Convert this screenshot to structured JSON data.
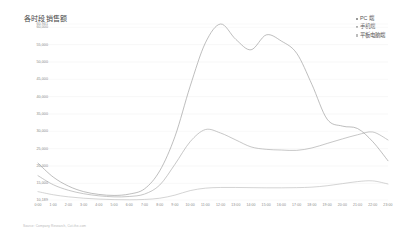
{
  "title": "各时段销售额",
  "footer": "Source: Company Research, Cut-the-com",
  "colors": {
    "pc": "#9a9a9a",
    "mobile": "#a8a8a8",
    "tablet": "#bdbdbd",
    "grid": "#f0f0f0",
    "axis_text": "#8a8a8a"
  },
  "legend": {
    "position": "top-right",
    "items": [
      {
        "label": "PC 端",
        "color": "#9a9a9a",
        "key": "pc"
      },
      {
        "label": "手机端",
        "color": "#a8a8a8",
        "key": "mobile"
      },
      {
        "label": "平板电脑端",
        "color": "#bdbdbd",
        "key": "tablet"
      }
    ]
  },
  "chart_data": {
    "type": "line",
    "title": "各时段销售额",
    "xlabel": "",
    "ylabel": "",
    "grid": true,
    "ylim": [
      10189,
      60941
    ],
    "yticks": [
      10189,
      15000,
      20000,
      25000,
      30000,
      35000,
      40000,
      45000,
      50000,
      55000,
      60000,
      60941
    ],
    "ytick_labels": [
      "10,189",
      "15,000",
      "20,000",
      "25,000",
      "30,000",
      "35,000",
      "40,000",
      "45,000",
      "50,000",
      "55,000",
      "60,000",
      "60,941"
    ],
    "categories": [
      "0:00",
      "1:00",
      "2:00",
      "3:00",
      "4:00",
      "5:00",
      "6:00",
      "7:00",
      "8:00",
      "9:00",
      "10:00",
      "11:00",
      "12:00",
      "13:00",
      "14:00",
      "15:00",
      "16:00",
      "17:00",
      "18:00",
      "19:00",
      "20:00",
      "21:00",
      "22:00",
      "23:00"
    ],
    "series": [
      {
        "name": "PC 端",
        "color": "#9a9a9a",
        "values": [
          20800,
          16800,
          14200,
          12600,
          11800,
          11500,
          11900,
          13400,
          18600,
          28500,
          43000,
          55500,
          60941,
          56500,
          53500,
          57800,
          56000,
          52500,
          43500,
          33500,
          31500,
          30800,
          27000,
          21500
        ]
      },
      {
        "name": "手机端",
        "color": "#a8a8a8",
        "values": [
          17200,
          14600,
          13000,
          12000,
          11400,
          11100,
          11200,
          11900,
          14500,
          20500,
          27000,
          30500,
          29500,
          27500,
          25500,
          24800,
          24600,
          24500,
          25200,
          26500,
          27800,
          29000,
          29800,
          27500
        ]
      },
      {
        "name": "平板电脑端",
        "color": "#bdbdbd",
        "values": [
          12600,
          11700,
          11100,
          10700,
          10450,
          10300,
          10250,
          10350,
          10700,
          11600,
          12900,
          13600,
          13800,
          13800,
          13750,
          13700,
          13700,
          13750,
          13900,
          14300,
          14900,
          15500,
          15700,
          14800
        ]
      }
    ]
  }
}
